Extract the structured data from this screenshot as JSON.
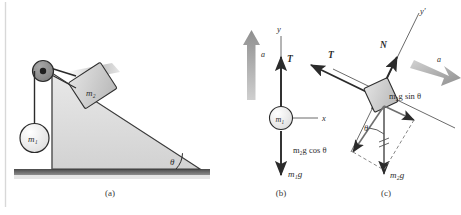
{
  "figure": {
    "background_color": "#ffffff",
    "ink_color": "#2b2b2b",
    "accel_arrow_color": "#9a9a9a",
    "incline_fill": "#dcdcdc",
    "block_fill": "#c9c9c9",
    "ground_color": "#555555",
    "captions": {
      "a": "(a)",
      "b": "(b)",
      "c": "(c)"
    }
  },
  "panel_a": {
    "name": "incline-system",
    "labels": {
      "mass1": "m₁",
      "mass2": "m₂",
      "angle": "θ"
    },
    "parts": {
      "pulley": "pulley",
      "rope": "rope",
      "incline": "inclined-plane",
      "ground": "ground-surface"
    }
  },
  "panel_b": {
    "name": "free-body-diagram-m1",
    "labels": {
      "axis_y": "y",
      "axis_x": "x",
      "accel": "a",
      "tension": "T",
      "mass": "m₁",
      "weight": "m₁g"
    }
  },
  "panel_c": {
    "name": "free-body-diagram-m2",
    "labels": {
      "axis_y_prime": "y′",
      "normal": "N",
      "tension": "T",
      "accel": "a",
      "weight": "m₂g",
      "weight_parallel": "m₂g sin θ",
      "weight_perpendicular": "m₂g cos θ",
      "angle": "θ"
    }
  }
}
